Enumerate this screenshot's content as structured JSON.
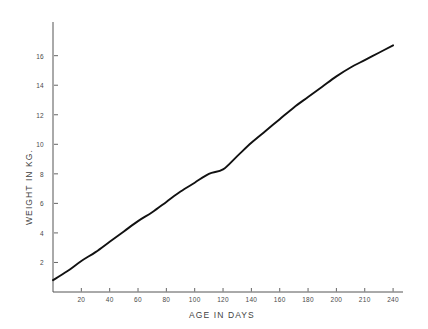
{
  "chart_data": {
    "type": "line",
    "title": "",
    "xlabel": "AGE IN DAYS",
    "ylabel": "WEIGHT IN KG.",
    "xlim": [
      0,
      247
    ],
    "ylim": [
      0,
      17.6
    ],
    "grid": false,
    "legend": null,
    "xticks": [
      20,
      40,
      60,
      80,
      100,
      120,
      140,
      160,
      180,
      200,
      220,
      240
    ],
    "xtick_labels": [
      "20",
      "40",
      "60",
      "80",
      "100",
      "120",
      "140",
      "160",
      "180",
      "200",
      "210",
      "240"
    ],
    "yticks": [
      2,
      4,
      6,
      8,
      10,
      12,
      14,
      16
    ],
    "ytick_labels": [
      "2",
      "4",
      "6",
      "8",
      "10",
      "12",
      "14",
      "16"
    ],
    "series": [
      {
        "name": "growth curve",
        "color": "#111111",
        "x": [
          0,
          10,
          20,
          30,
          40,
          50,
          60,
          70,
          80,
          90,
          100,
          110,
          120,
          130,
          140,
          150,
          160,
          170,
          180,
          190,
          200,
          210,
          220,
          230,
          240
        ],
        "y": [
          0.8,
          1.4,
          2.1,
          2.7,
          3.4,
          4.1,
          4.8,
          5.4,
          6.1,
          6.8,
          7.4,
          8.0,
          8.3,
          9.2,
          10.1,
          10.9,
          11.7,
          12.5,
          13.2,
          13.9,
          14.6,
          15.2,
          15.7,
          16.2,
          16.7
        ]
      }
    ]
  },
  "axis": {
    "x_title": "AGE IN DAYS",
    "y_title": "WEIGHT IN KG."
  }
}
